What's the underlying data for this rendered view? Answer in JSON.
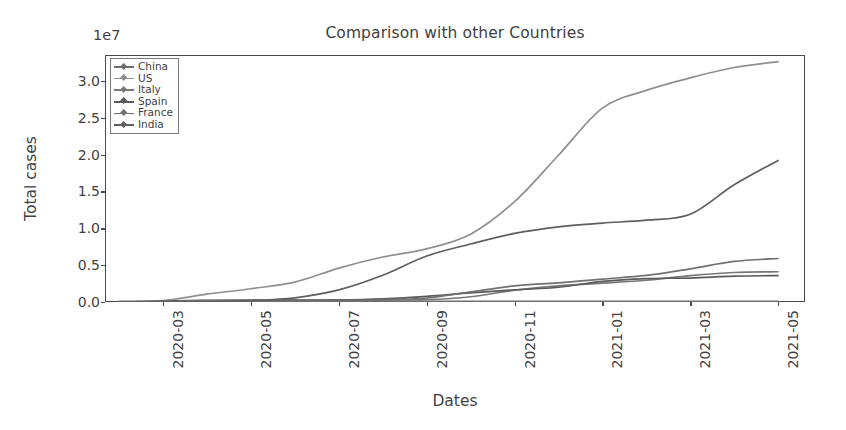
{
  "chart_data": {
    "type": "line",
    "title": "Comparison with other Countries",
    "xlabel": "Dates",
    "ylabel": "Total cases",
    "y_offset_text": "1e7",
    "y_offset_multiplier": 10000000,
    "grid": false,
    "legend_position": "upper left",
    "xtick_labels": [
      "2020-03",
      "2020-05",
      "2020-07",
      "2020-09",
      "2020-11",
      "2021-01",
      "2021-03",
      "2021-05"
    ],
    "ytick_labels": [
      "0.0",
      "0.5",
      "1.0",
      "1.5",
      "2.0",
      "2.5",
      "3.0"
    ],
    "ytick_values": [
      0,
      5000000,
      10000000,
      15000000,
      20000000,
      25000000,
      30000000
    ],
    "ylim": [
      0,
      33500000
    ],
    "xlim": [
      "2020-01-22",
      "2021-05-20"
    ],
    "x": [
      "2020-02",
      "2020-03",
      "2020-04",
      "2020-05",
      "2020-06",
      "2020-07",
      "2020-08",
      "2020-09",
      "2020-10",
      "2020-11",
      "2020-12",
      "2021-01",
      "2021-02",
      "2021-03",
      "2021-04",
      "2021-05"
    ],
    "series": [
      {
        "name": "China",
        "color": "#6e6e6e",
        "marker": "diamond",
        "values": [
          80000,
          82000,
          84000,
          85000,
          85000,
          88000,
          90000,
          91000,
          92000,
          93000,
          96000,
          100000,
          101000,
          102000,
          103000,
          104000
        ]
      },
      {
        "name": "US",
        "color": "#8f8f8f",
        "marker": "diamond",
        "values": [
          30,
          190000,
          1070000,
          1800000,
          2700000,
          4600000,
          6100000,
          7200000,
          9200000,
          13600000,
          19900000,
          26300000,
          28700000,
          30400000,
          31800000,
          32600000
        ]
      },
      {
        "name": "Italy",
        "color": "#787878",
        "marker": "diamond",
        "values": [
          1000,
          105000,
          205000,
          233000,
          240000,
          248000,
          270000,
          314000,
          709000,
          1600000,
          2200000,
          2560000,
          2950000,
          3580000,
          4000000,
          4100000
        ]
      },
      {
        "name": "Spain",
        "color": "#5a5a5a",
        "marker": "diamond",
        "values": [
          2000,
          110000,
          213000,
          240000,
          248000,
          280000,
          440000,
          770000,
          1240000,
          1650000,
          2000000,
          2800000,
          3180000,
          3250000,
          3500000,
          3580000
        ]
      },
      {
        "name": "France",
        "color": "#707070",
        "marker": "diamond",
        "values": [
          2000,
          52000,
          167000,
          186000,
          200000,
          215000,
          290000,
          540000,
          1380000,
          2200000,
          2600000,
          3100000,
          3600000,
          4500000,
          5500000,
          5900000
        ]
      },
      {
        "name": "India",
        "color": "#5f5f5f",
        "marker": "diamond",
        "values": [
          3,
          1400,
          35000,
          190000,
          570000,
          1640000,
          3620000,
          6230000,
          7860000,
          9300000,
          10200000,
          10700000,
          11100000,
          11900000,
          15900000,
          19200000
        ]
      }
    ]
  }
}
